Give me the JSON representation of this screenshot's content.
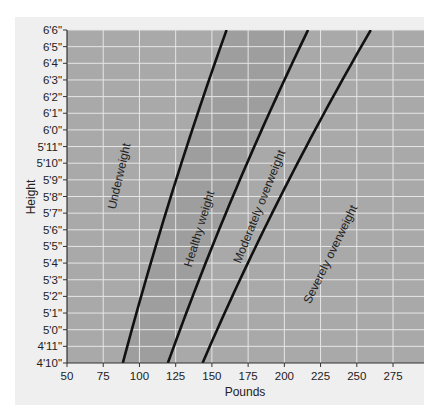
{
  "chart_data": {
    "type": "line",
    "title": "",
    "xlabel": "Pounds",
    "ylabel": "Height",
    "xlim": [
      50,
      296
    ],
    "ylim_inches": [
      58,
      78
    ],
    "x_ticks": [
      50,
      75,
      100,
      125,
      150,
      175,
      200,
      225,
      250,
      275
    ],
    "y_ticks": [
      "4'10\"",
      "4'11\"",
      "5'0\"",
      "5'1\"",
      "5'2\"",
      "5'3\"",
      "5'4\"",
      "5'5\"",
      "5'6\"",
      "5'7\"",
      "5'8\"",
      "5'9\"",
      "5'10\"",
      "5'11\"",
      "6'0\"",
      "6'1\"",
      "6'2\"",
      "6'3\"",
      "6'4\"",
      "6'5\"",
      "6'6\""
    ],
    "grid": true,
    "series": [
      {
        "name": "Underweight / Healthy weight boundary",
        "bmi": 18.5,
        "points": [
          [
            88.5,
            58
          ],
          [
            98.1,
            61
          ],
          [
            108.1,
            64
          ],
          [
            118.6,
            67
          ],
          [
            129.6,
            70
          ],
          [
            141.0,
            73
          ],
          [
            153.0,
            76
          ],
          [
            160.1,
            78
          ]
        ]
      },
      {
        "name": "Healthy weight / Moderately overweight boundary",
        "bmi": 25,
        "points": [
          [
            119.6,
            58
          ],
          [
            132.6,
            61
          ],
          [
            146.1,
            64
          ],
          [
            160.3,
            67
          ],
          [
            175.1,
            70
          ],
          [
            190.6,
            73
          ],
          [
            206.7,
            76
          ],
          [
            216.4,
            78
          ]
        ]
      },
      {
        "name": "Moderately overweight / Severely overweight boundary",
        "bmi": 30,
        "points": [
          [
            143.6,
            58
          ],
          [
            159.1,
            61
          ],
          [
            175.3,
            64
          ],
          [
            192.3,
            67
          ],
          [
            210.1,
            70
          ],
          [
            228.7,
            73
          ],
          [
            248.0,
            76
          ],
          [
            259.6,
            78
          ]
        ]
      }
    ],
    "regions": [
      {
        "label": "Underweight",
        "shade": "#a9a9a9"
      },
      {
        "label": "Healthy weight",
        "shade": "#9e9e9e"
      },
      {
        "label": "Moderately overweight",
        "shade": "#a9a9a9"
      },
      {
        "label": "Severely overweight",
        "shade": "#a9a9a9"
      }
    ]
  },
  "labels": {
    "xlabel": "Pounds",
    "ylabel": "Height",
    "regions": [
      "Underweight",
      "Healthy weight",
      "Moderately overweight",
      "Severely overweight"
    ]
  },
  "colors": {
    "plot_bg": "#a9a9a9",
    "healthy_band": "#9e9e9e",
    "grid": "#e6e6e6",
    "curve": "#111111",
    "panel_bg": "#efefef"
  }
}
